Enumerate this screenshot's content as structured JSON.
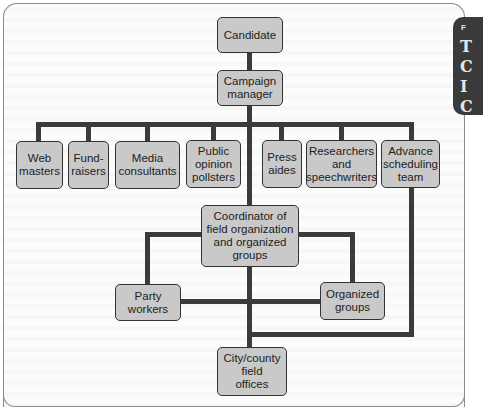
{
  "diagram": {
    "type": "org-chart",
    "nodes": {
      "candidate": "Candidate",
      "campaign_manager": "Campaign\nmanager",
      "web_masters": "Web\nmasters",
      "fund_raisers": "Fund-\nraisers",
      "media_consultants": "Media\nconsultants",
      "public_opinion_pollsters": "Public\nopinion\npollsters",
      "press_aides": "Press\naides",
      "researchers_speechwriters": "Researchers\nand\nspeechwriters",
      "advance_scheduling_team": "Advance\nscheduling\nteam",
      "coordinator": "Coordinator of\nfield organization\nand organized\ngroups",
      "party_workers": "Party\nworkers",
      "organized_groups": "Organized\ngroups",
      "city_county_offices": "City/county\nfield\noffices"
    },
    "edges": [
      [
        "Candidate",
        "Campaign manager"
      ],
      [
        "Campaign manager",
        "Web masters"
      ],
      [
        "Campaign manager",
        "Fund-raisers"
      ],
      [
        "Campaign manager",
        "Media consultants"
      ],
      [
        "Campaign manager",
        "Public opinion pollsters"
      ],
      [
        "Campaign manager",
        "Press aides"
      ],
      [
        "Campaign manager",
        "Researchers and speechwriters"
      ],
      [
        "Campaign manager",
        "Advance scheduling team"
      ],
      [
        "Campaign manager",
        "Coordinator of field organization and organized groups"
      ],
      [
        "Coordinator of field organization and organized groups",
        "Party workers"
      ],
      [
        "Coordinator of field organization and organized groups",
        "Organized groups"
      ],
      [
        "Coordinator of field organization and organized groups",
        "City/county field offices"
      ],
      [
        "Party workers",
        "Organized groups"
      ],
      [
        "Advance scheduling team",
        "City/county field offices"
      ]
    ]
  },
  "side_tab": {
    "small_letter": "F",
    "big_letters": [
      "T",
      "C",
      "I",
      "C"
    ]
  },
  "colors": {
    "node_fill": "#c9c9c9",
    "node_border": "#333333",
    "connector": "#3b3b3b",
    "tab": "#3a3a3a"
  }
}
